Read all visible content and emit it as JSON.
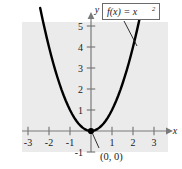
{
  "chart_data": {
    "type": "line",
    "title": "",
    "function_label": "f(x) = x",
    "function_exponent": "2",
    "xlabel": "x",
    "ylabel": "y",
    "xlim": [
      -3.6,
      3.8
    ],
    "ylim": [
      -1.6,
      5.9
    ],
    "xticks": [
      "-3",
      "-2",
      "-1",
      "1",
      "2",
      "3"
    ],
    "xtick_values": [
      -3,
      -2,
      -1,
      1,
      2,
      3
    ],
    "yticks": [
      "5",
      "4",
      "3",
      "2",
      "1",
      "-1"
    ],
    "ytick_values": [
      5,
      4,
      3,
      2,
      1,
      -1
    ],
    "grid": false,
    "legend": "none",
    "annotations": [
      {
        "text": "(0, 0)",
        "x": 0,
        "y": 0,
        "description": "vertex-point-label"
      }
    ],
    "series": [
      {
        "name": "f(x) = x^2",
        "x": [
          -2.42,
          -2.3,
          -2.2,
          -2.1,
          -2.0,
          -1.9,
          -1.8,
          -1.7,
          -1.6,
          -1.5,
          -1.4,
          -1.3,
          -1.2,
          -1.1,
          -1.0,
          -0.9,
          -0.8,
          -0.7,
          -0.6,
          -0.5,
          -0.4,
          -0.3,
          -0.2,
          -0.1,
          0,
          0.1,
          0.2,
          0.3,
          0.4,
          0.5,
          0.6,
          0.7,
          0.8,
          0.9,
          1.0,
          1.1,
          1.2,
          1.3,
          1.4,
          1.5,
          1.6,
          1.7,
          1.8,
          1.9,
          2.0,
          2.1,
          2.2,
          2.3,
          2.42
        ],
        "y": [
          5.86,
          5.29,
          4.84,
          4.41,
          4.0,
          3.61,
          3.24,
          2.89,
          2.56,
          2.25,
          1.96,
          1.69,
          1.44,
          1.21,
          1.0,
          0.81,
          0.64,
          0.49,
          0.36,
          0.25,
          0.16,
          0.09,
          0.04,
          0.01,
          0,
          0.01,
          0.04,
          0.09,
          0.16,
          0.25,
          0.36,
          0.49,
          0.64,
          0.81,
          1.0,
          1.21,
          1.44,
          1.69,
          1.96,
          2.25,
          2.56,
          2.89,
          3.24,
          3.61,
          4.0,
          4.41,
          4.84,
          5.29,
          5.86
        ],
        "color": "#000000"
      }
    ],
    "colors": {
      "plot_background": "#ebebeb",
      "page_background": "#ffffff",
      "curve": "#000000",
      "axis": "#7a7a7a",
      "text": "#1a1a1a",
      "label_box_border": "#6b6b6b",
      "label_box_fill": "#ffffff"
    }
  }
}
